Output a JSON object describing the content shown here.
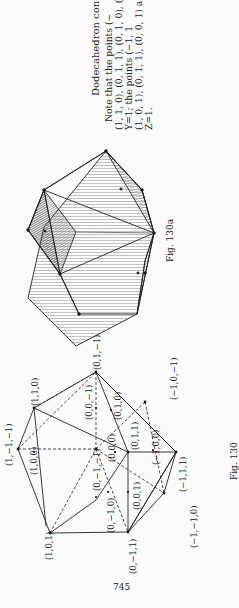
{
  "page": {
    "number": "745",
    "orientation": "rotated-90-ccw"
  },
  "caption_block": {
    "title": "Dodecahedron cont",
    "lines": [
      "Note that the points (−",
      "(1, 1, 0), (0, 1, 1), (0, 1, 0), (",
      "Y=1;  the  points  (−1, 1",
      "(1, 0, 1), (0, 1, 1), (0, 0, 1) a",
      "Z=1."
    ]
  },
  "figures": [
    {
      "label": "Fig. 130a",
      "description": "Shaded projection of dodecahedron"
    },
    {
      "label": "Fig. 130",
      "description": "Wireframe dodecahedron with labeled vertices",
      "vertex_labels": [
        "(1,−1,−1)",
        "(1,1,0)",
        "(0,1,−1)",
        "(1,0,0)",
        "(1,0,1)",
        "(0,0,−1)",
        "(0,1,0)",
        "(−1,0,−1)",
        "(0,−1,−1)",
        "(0,0,0)",
        "(0,1,1)",
        "(−1,0,0)",
        "(0,−1,0)",
        "(0,0,1)",
        "(−1,1,1)",
        "(0,−1,1)",
        "(−1,−1,0)"
      ]
    }
  ]
}
